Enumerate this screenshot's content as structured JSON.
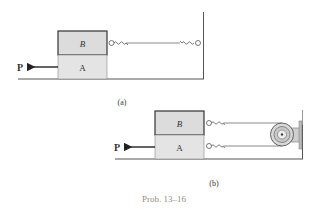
{
  "figure_a": {
    "caption": "(a)",
    "block_top_label": "B",
    "block_bottom_label": "A",
    "force_label": "P"
  },
  "figure_b": {
    "caption": "(b)",
    "block_top_label": "B",
    "block_bottom_label": "A",
    "force_label": "P"
  },
  "problem_label": "Prob. 13–16",
  "colors": {
    "block_fill": "#dcdcdc",
    "line": "#333333",
    "cable": "#8a8a8a",
    "problem_label": "#9a8a80"
  }
}
